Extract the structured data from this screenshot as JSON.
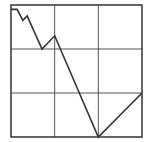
{
  "chart_data": {
    "type": "line",
    "title": "",
    "xlabel": "",
    "ylabel": "",
    "grid": true,
    "grid_divisions": {
      "x": 3,
      "y": 3
    },
    "xlim": [
      0,
      3
    ],
    "ylim": [
      0,
      3
    ],
    "x": [
      0,
      0.14,
      0.27,
      0.37,
      0.71,
      1.0,
      2.0,
      3.0
    ],
    "series": [
      {
        "name": "series-1",
        "values": [
          2.9,
          2.9,
          2.65,
          2.75,
          2.0,
          2.3,
          0.0,
          1.0
        ]
      }
    ],
    "legend": null,
    "colors": {
      "line": "#333333",
      "frame": "#333333",
      "grid": "#555555",
      "background": "#ffffff"
    }
  },
  "layout": {
    "frame": {
      "left": 11,
      "top": 5,
      "right": 142,
      "bottom": 137
    }
  }
}
